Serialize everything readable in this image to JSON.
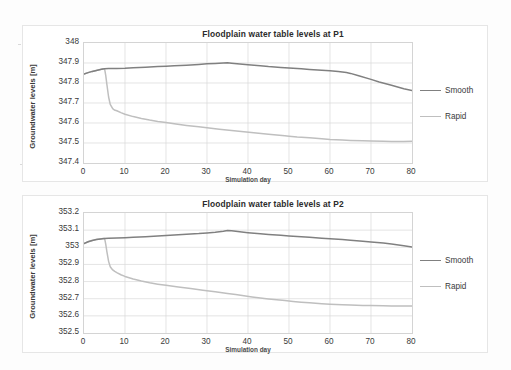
{
  "figure": {
    "background": "#fdfdfd",
    "panel_background": "#ffffff",
    "series_colors": {
      "smooth": "#808080",
      "rapid": "#bfbfbf"
    },
    "grid_color": "#d9d9d9",
    "axis_color": "#d4d4d4"
  },
  "legend": {
    "items": [
      {
        "label": "Smooth",
        "color": "#808080"
      },
      {
        "label": "Rapid",
        "color": "#bfbfbf"
      }
    ]
  },
  "chart_data": [
    {
      "id": "P1",
      "type": "line",
      "title": "Floodplain water table levels at P1",
      "xlabel": "Simulation day",
      "ylabel": "Groundwater levels [m]",
      "xlim": [
        0,
        80
      ],
      "ylim": [
        347.4,
        348
      ],
      "xticks": [
        0,
        10,
        20,
        30,
        40,
        50,
        60,
        70,
        80
      ],
      "yticks": [
        "348",
        "347.9",
        "347.8",
        "347.7",
        "347.6",
        "347.5",
        "347.4"
      ],
      "ytick_values": [
        348,
        347.9,
        347.8,
        347.7,
        347.6,
        347.5,
        347.4
      ],
      "grid": true,
      "legend_position": "right",
      "series": [
        {
          "name": "Smooth",
          "color": "#808080",
          "x": [
            0,
            1,
            2,
            3,
            4,
            5,
            6,
            8,
            10,
            12,
            15,
            18,
            20,
            22,
            25,
            28,
            30,
            32,
            34,
            35,
            36,
            38,
            40,
            43,
            45,
            48,
            50,
            53,
            55,
            58,
            60,
            62,
            64,
            65,
            67,
            70,
            72,
            75,
            78,
            80
          ],
          "y": [
            347.845,
            347.852,
            347.858,
            347.863,
            347.868,
            347.871,
            347.872,
            347.873,
            347.874,
            347.876,
            347.879,
            347.882,
            347.884,
            347.886,
            347.889,
            347.893,
            347.896,
            347.898,
            347.9,
            347.901,
            347.899,
            347.895,
            347.891,
            347.886,
            347.882,
            347.878,
            347.875,
            347.871,
            347.868,
            347.864,
            347.861,
            347.857,
            347.852,
            347.848,
            347.836,
            347.818,
            347.805,
            347.789,
            347.771,
            347.762
          ]
        },
        {
          "name": "Rapid",
          "color": "#bfbfbf",
          "x": [
            0,
            1,
            2,
            3,
            4,
            4.6,
            5,
            5.1,
            5.3,
            5.6,
            6,
            6.4,
            7,
            7.4,
            8,
            9,
            10,
            12,
            14,
            16,
            18,
            20,
            22,
            25,
            28,
            30,
            33,
            36,
            39,
            42,
            45,
            47,
            49,
            50,
            52,
            55,
            58,
            60,
            63,
            65,
            68,
            70,
            73,
            75,
            78,
            80
          ],
          "y": [
            347.845,
            347.852,
            347.858,
            347.863,
            347.868,
            347.871,
            347.871,
            347.862,
            347.838,
            347.79,
            347.73,
            347.693,
            347.672,
            347.665,
            347.661,
            347.652,
            347.644,
            347.632,
            347.623,
            347.615,
            347.608,
            347.602,
            347.596,
            347.588,
            347.581,
            347.576,
            347.569,
            347.562,
            347.556,
            347.55,
            347.544,
            347.54,
            347.536,
            347.534,
            347.53,
            347.526,
            347.521,
            347.518,
            347.515,
            347.513,
            347.511,
            347.51,
            347.509,
            347.508,
            347.508,
            347.509
          ]
        }
      ]
    },
    {
      "id": "P2",
      "type": "line",
      "title": "Floodplain water table levels at P2",
      "xlabel": "Simulation day",
      "ylabel": "Groundwater levels [m]",
      "xlim": [
        0,
        80
      ],
      "ylim": [
        352.5,
        353.2
      ],
      "xticks": [
        0,
        10,
        20,
        30,
        40,
        50,
        60,
        70,
        80
      ],
      "yticks": [
        "353.2",
        "353.1",
        "353",
        "352.9",
        "352.8",
        "352.7",
        "352.6",
        "352.5"
      ],
      "ytick_values": [
        353.2,
        353.1,
        353,
        352.9,
        352.8,
        352.7,
        352.6,
        352.5
      ],
      "grid": true,
      "legend_position": "right",
      "series": [
        {
          "name": "Smooth",
          "color": "#808080",
          "x": [
            0,
            1,
            2,
            3,
            4,
            5,
            6,
            8,
            10,
            12,
            15,
            18,
            20,
            23,
            25,
            28,
            30,
            32,
            34,
            35,
            36,
            38,
            40,
            43,
            45,
            48,
            50,
            53,
            55,
            58,
            60,
            63,
            65,
            68,
            70,
            73,
            75,
            78,
            80
          ],
          "y": [
            353.022,
            353.032,
            353.04,
            353.045,
            353.049,
            353.051,
            353.052,
            353.054,
            353.056,
            353.058,
            353.062,
            353.066,
            353.069,
            353.073,
            353.076,
            353.08,
            353.084,
            353.088,
            353.094,
            353.098,
            353.096,
            353.09,
            353.085,
            353.079,
            353.075,
            353.07,
            353.066,
            353.061,
            353.058,
            353.053,
            353.05,
            353.045,
            353.041,
            353.035,
            353.031,
            353.025,
            353.019,
            353.009,
            353.001
          ]
        },
        {
          "name": "Rapid",
          "color": "#bfbfbf",
          "x": [
            0,
            1,
            2,
            3,
            4,
            4.6,
            5,
            5.1,
            5.3,
            5.6,
            6,
            6.4,
            7,
            7.5,
            8,
            9,
            10,
            12,
            14,
            16,
            18,
            20,
            23,
            26,
            29,
            32,
            35,
            37,
            39,
            41,
            43,
            45,
            47,
            49,
            51,
            53,
            55,
            58,
            60,
            63,
            65,
            68,
            70,
            73,
            75,
            78,
            80
          ],
          "y": [
            353.022,
            353.032,
            353.04,
            353.045,
            353.049,
            353.051,
            353.051,
            353.043,
            353.018,
            352.972,
            352.918,
            352.886,
            352.868,
            352.859,
            352.852,
            352.84,
            352.83,
            352.815,
            352.803,
            352.793,
            352.785,
            352.778,
            352.768,
            352.759,
            352.75,
            352.741,
            352.731,
            352.724,
            352.717,
            352.71,
            352.704,
            352.699,
            352.694,
            352.689,
            352.684,
            352.68,
            352.676,
            352.671,
            352.668,
            352.665,
            352.663,
            352.661,
            352.66,
            352.659,
            352.658,
            352.657,
            352.657
          ]
        }
      ]
    }
  ]
}
